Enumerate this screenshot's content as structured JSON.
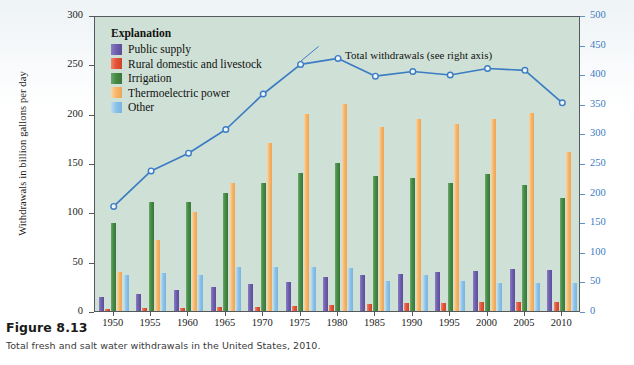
{
  "figure": {
    "caption_title": "Figure 8.13",
    "caption_text": "Total fresh and salt water withdrawals in the United States, 2010."
  },
  "legend": {
    "title": "Explanation",
    "items": [
      {
        "label": "Public supply",
        "color": "#6f5fae",
        "key": "public"
      },
      {
        "label": "Rural domestic and livestock",
        "color": "#e2553a",
        "key": "rural"
      },
      {
        "label": "Irrigation",
        "color": "#458a45",
        "key": "irrigation"
      },
      {
        "label": "Thermoelectric power",
        "color": "#f6b76b",
        "key": "thermoelectric"
      },
      {
        "label": "Other",
        "color": "#8cc2e8",
        "key": "other"
      }
    ]
  },
  "annotation": {
    "line_callout": "Total withdrawals (see right axis)"
  },
  "colors": {
    "plot_background": "#cfe1d6",
    "axis": "#55595b",
    "line": "#3b7cc4",
    "right_axis_text": "#3b7cc4",
    "page_background": "#ffffff"
  },
  "chart_data": {
    "type": "bar",
    "title": "",
    "subtitle": "",
    "xlabel": "",
    "ylabel": "Withdrawals in billion gallons per day",
    "y2label": "Total withdrawals in billion gallons per day",
    "categories": [
      "1950",
      "1955",
      "1960",
      "1965",
      "1970",
      "1975",
      "1980",
      "1985",
      "1990",
      "1995",
      "2000",
      "2005",
      "2010"
    ],
    "ylim": [
      0,
      300
    ],
    "yticks": [
      0,
      50,
      100,
      150,
      200,
      250,
      300
    ],
    "y2lim": [
      0,
      500
    ],
    "y2ticks": [
      0,
      50,
      100,
      150,
      200,
      250,
      300,
      350,
      400,
      450,
      500
    ],
    "grid": false,
    "legend_position": "top-left",
    "series": [
      {
        "name": "Public supply",
        "axis": "left",
        "color": "#6f5fae",
        "values": [
          14,
          17,
          21,
          24,
          27,
          29,
          34,
          36,
          38,
          40,
          41,
          43,
          42
        ]
      },
      {
        "name": "Rural domestic and livestock",
        "axis": "left",
        "color": "#e2553a",
        "values": [
          2,
          3,
          3,
          4,
          4,
          5,
          6,
          7,
          8,
          8,
          9,
          9,
          9
        ]
      },
      {
        "name": "Irrigation",
        "axis": "left",
        "color": "#458a45",
        "values": [
          89,
          110,
          110,
          120,
          130,
          140,
          150,
          137,
          135,
          130,
          139,
          128,
          115
        ]
      },
      {
        "name": "Thermoelectric power",
        "axis": "left",
        "color": "#f6b76b",
        "values": [
          40,
          72,
          100,
          130,
          170,
          200,
          210,
          187,
          195,
          190,
          195,
          201,
          161
        ]
      },
      {
        "name": "Other",
        "axis": "left",
        "color": "#8cc2e8",
        "values": [
          37,
          39,
          37,
          45,
          45,
          45,
          44,
          30,
          36,
          30,
          28,
          28,
          28
        ]
      }
    ],
    "line_series": {
      "name": "Total withdrawals",
      "axis": "right",
      "color": "#3b7cc4",
      "marker": "open-circle",
      "values": [
        180,
        240,
        270,
        310,
        370,
        420,
        430,
        400,
        408,
        402,
        413,
        410,
        355
      ]
    }
  }
}
